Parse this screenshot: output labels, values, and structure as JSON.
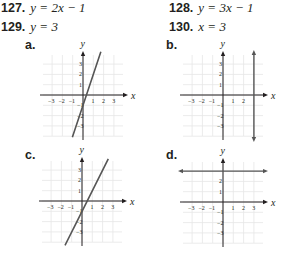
{
  "problems": [
    {
      "number": "127.",
      "equation": "y = 2x − 1"
    },
    {
      "number": "128.",
      "equation": "y = 3x − 1"
    },
    {
      "number": "129.",
      "equation": "y = 3"
    },
    {
      "number": "130.",
      "equation": "x = 3"
    }
  ],
  "graphs": [
    {
      "label": "a.",
      "description": "line y = 3x - 1",
      "line": {
        "type": "slope",
        "slope": 3,
        "intercept": -1
      }
    },
    {
      "label": "b.",
      "description": "vertical line x = 3",
      "line": {
        "type": "vertical",
        "x": 3
      }
    },
    {
      "label": "c.",
      "description": "line y = 2x - 1",
      "line": {
        "type": "slope",
        "slope": 2,
        "intercept": -1
      }
    },
    {
      "label": "d.",
      "description": "horizontal line y = 3",
      "line": {
        "type": "horizontal",
        "y": 3
      }
    }
  ],
  "axes": {
    "x_label": "x",
    "y_label": "y",
    "x_ticks": [
      "−3",
      "−2",
      "−1",
      "1",
      "2",
      "3"
    ],
    "y_ticks": [
      "3",
      "2",
      "1",
      "−1",
      "−2",
      "−3"
    ]
  },
  "colors": {
    "text": "#231f20",
    "grid": "#e6e6e6",
    "axis": "#231f20",
    "line": "#555555"
  }
}
